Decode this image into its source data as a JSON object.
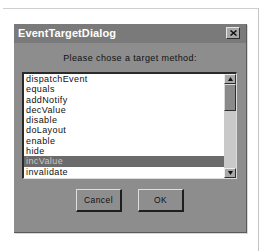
{
  "dialog": {
    "title": "EventTargetDialog",
    "close_icon": "close-x-icon",
    "prompt": "Please chose a target method:",
    "list": {
      "items": [
        {
          "label": "dispatchEvent",
          "selected": false
        },
        {
          "label": "equals",
          "selected": false
        },
        {
          "label": "addNotify",
          "selected": false
        },
        {
          "label": "decValue",
          "selected": false
        },
        {
          "label": "disable",
          "selected": false
        },
        {
          "label": "doLayout",
          "selected": false
        },
        {
          "label": "enable",
          "selected": false
        },
        {
          "label": "hide",
          "selected": false
        },
        {
          "label": "incValue",
          "selected": true
        },
        {
          "label": "invalidate",
          "selected": false
        }
      ],
      "selected_value": "incValue",
      "scrollbar": {
        "up_icon": "arrow-up-icon",
        "down_icon": "arrow-down-icon"
      }
    },
    "buttons": {
      "cancel_label": "Cancel",
      "ok_label": "OK"
    }
  },
  "colors": {
    "dialog_bg": "#8d8d8d",
    "titlebar_bg": "#7a7a7a",
    "selected_bg": "#6b6b6b",
    "list_bg": "#ffffff"
  }
}
